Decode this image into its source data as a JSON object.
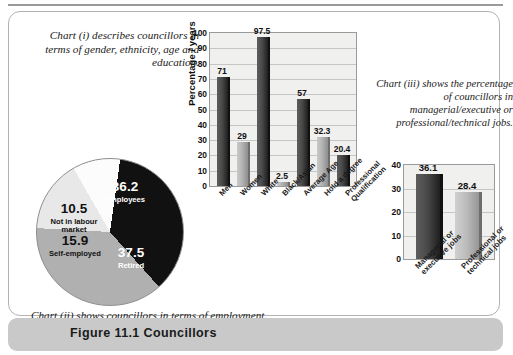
{
  "figure": {
    "caption": "Figure 11.1 Councillors"
  },
  "descriptions": {
    "chart_i": "Chart (i) describes councillors in terms of gender, ethnicity, age and education.",
    "chart_ii": "Chart (ii) shows councillors in terms of employment.",
    "chart_iii": "Chart (iii) shows the percentage of councillors in managerial/executive or professional/technical jobs."
  },
  "colors": {
    "bar_dark": "#2b2b2b",
    "bar_light": "#b4b4b4",
    "plot_bg": "#f0f0ef",
    "caption_bar": "#c9c9c9",
    "panel_border": "#b3b3b3"
  },
  "chart_data": [
    {
      "type": "bar",
      "id": "chart-i",
      "title": "",
      "xlabel": "",
      "ylabel": "Percentage / years",
      "ylim": [
        0,
        100
      ],
      "yticks": [
        100,
        90,
        80,
        70,
        60,
        50,
        40,
        30,
        20,
        10,
        0
      ],
      "grid": true,
      "legend": "none",
      "categories": [
        "Men",
        "Women",
        "White",
        "Black/Asian",
        "Average Age",
        "Hold a degree",
        "Professional Qualification"
      ],
      "category_lines": [
        [
          "Men"
        ],
        [
          "Women"
        ],
        [
          "White"
        ],
        [
          "Black/Asian"
        ],
        [
          "Average Age"
        ],
        [
          "Hold a degree"
        ],
        [
          "Professional",
          "Qualification"
        ]
      ],
      "values": [
        71,
        29,
        97.5,
        2.5,
        57,
        32.3,
        20.4
      ],
      "value_labels": [
        "71",
        "29",
        "97.5",
        "2.5",
        "57",
        "32.3",
        "20.4"
      ],
      "shades": [
        "dark",
        "light",
        "dark",
        "light",
        "dark",
        "light",
        "dark"
      ]
    },
    {
      "type": "pie",
      "id": "chart-ii",
      "title": "",
      "legend": "inside-slices",
      "categories": [
        "Employees",
        "Retired",
        "Self-employed",
        "Not in labour market"
      ],
      "values": [
        36.2,
        37.5,
        15.9,
        10.5
      ],
      "value_labels": [
        "36.2",
        "37.5",
        "15.9",
        "10.5"
      ],
      "slice_colors": [
        "#111111",
        "#b0b0b0",
        "#e8e8e8",
        "#fcfcfc"
      ],
      "label_text_colors": [
        "#ffffff",
        "#ffffff",
        "#111111",
        "#111111"
      ]
    },
    {
      "type": "bar",
      "id": "chart-iii",
      "title": "",
      "xlabel": "",
      "ylabel": "",
      "ylim": [
        0,
        40
      ],
      "yticks": [
        40,
        30,
        20,
        10,
        0
      ],
      "grid": true,
      "legend": "none",
      "categories": [
        "Managerial or executive jobs",
        "Professional or technical jobs"
      ],
      "category_lines": [
        [
          "Managerial or",
          "executive jobs"
        ],
        [
          "Professional or",
          "technical jobs"
        ]
      ],
      "values": [
        36.1,
        28.4
      ],
      "value_labels": [
        "36.1",
        "28.4"
      ],
      "shades": [
        "dark",
        "light"
      ]
    }
  ]
}
